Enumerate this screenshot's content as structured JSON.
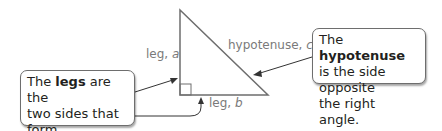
{
  "diagram": {
    "triangle": {
      "leg_a": {
        "text": "leg, ",
        "var": "a"
      },
      "leg_b": {
        "text": "leg, ",
        "var": "b"
      },
      "hypotenuse": {
        "text": "hypotenuse, ",
        "var": "c"
      }
    },
    "callout_legs": {
      "prefix": "The ",
      "bold": "legs",
      "line1_suffix": " are the",
      "line2": "two sides that form",
      "line3": "the right angle."
    },
    "callout_hypotenuse": {
      "prefix": "The ",
      "bold": "hypotenuse",
      "line2": "is the side opposite",
      "line3": "the right angle."
    },
    "colors": {
      "stroke": "#6e6e6e",
      "label": "#7a7a7a",
      "text": "#231f20"
    }
  }
}
